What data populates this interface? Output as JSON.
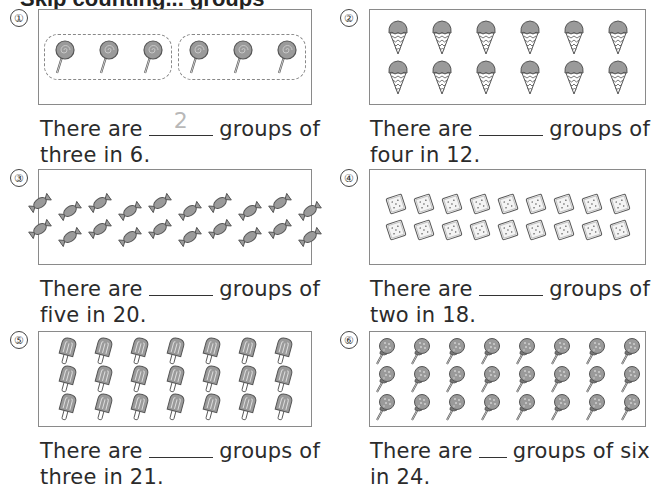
{
  "header": {
    "title_partial": "Skip counting... groups"
  },
  "problems": [
    {
      "number": "①",
      "item_icon": "lollipop-icon",
      "item_count": 6,
      "layout": {
        "rows": 1,
        "cols": 6,
        "groups": 2,
        "per_group": 3
      },
      "text_before": "There are",
      "answer": "2",
      "text_after": "groups of",
      "text_line2": "three in 6."
    },
    {
      "number": "②",
      "item_icon": "ice-cream-cone-icon",
      "item_count": 12,
      "layout": {
        "rows": 2,
        "cols": 6
      },
      "text_before": "There are",
      "answer": "",
      "text_after": "groups of",
      "text_line2": "four in 12."
    },
    {
      "number": "③",
      "item_icon": "wrapped-candy-icon",
      "item_count": 20,
      "layout": {
        "rows": 2,
        "cols": 10
      },
      "text_before": "There are",
      "answer": "",
      "text_after": "groups of",
      "text_line2": "five in 20."
    },
    {
      "number": "④",
      "item_icon": "cracker-icon",
      "item_count": 18,
      "layout": {
        "rows": 2,
        "cols": 9
      },
      "text_before": "There are",
      "answer": "",
      "text_after": "groups of",
      "text_line2": "two in 18."
    },
    {
      "number": "⑤",
      "item_icon": "popsicle-icon",
      "item_count": 21,
      "layout": {
        "rows": 3,
        "cols": 7
      },
      "text_before": "There are",
      "answer": "",
      "text_after": "groups of",
      "text_line2": "three in 21."
    },
    {
      "number": "⑥",
      "item_icon": "lollipop-ball-icon",
      "item_count": 24,
      "layout": {
        "rows": 3,
        "cols": 8
      },
      "text_before": "There are",
      "answer": "",
      "text_after": "groups of six",
      "text_line2": "in 24."
    }
  ],
  "colors": {
    "item_fill": "#9a9a9a",
    "item_stroke": "#555555",
    "box_border": "#8a8a8a",
    "answer_text": "#b8b8b8"
  }
}
